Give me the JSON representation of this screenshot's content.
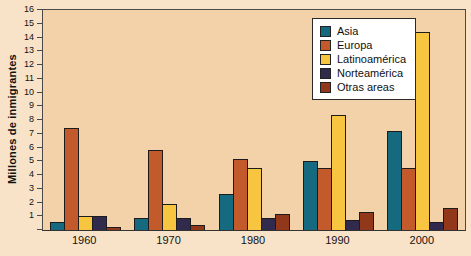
{
  "colors": {
    "page_bg": "#f8e3c9",
    "plot_bg": "#f3d2a9",
    "axis": "#4a4a4a",
    "bar_border": "#1c1c1c",
    "legend_bg": "#ffffff",
    "legend_border": "#2a2a2a",
    "text": "#111111"
  },
  "chart_data": {
    "type": "bar",
    "title": "",
    "xlabel": "",
    "ylabel": "Millones de inmigrantes",
    "ylim": [
      0,
      16
    ],
    "ytick_step": 1,
    "ytick_labels": [
      "1",
      "2",
      "3",
      "4",
      "5",
      "6",
      "7",
      "8",
      "9",
      "10",
      "11",
      "12",
      "13",
      "14",
      "15",
      "16"
    ],
    "grid": false,
    "legend_position": "top-right-inside",
    "categories": [
      "1960",
      "1970",
      "1980",
      "1990",
      "2000"
    ],
    "series": [
      {
        "name": "Asia",
        "color": "#156a7f",
        "values": [
          0.6,
          0.9,
          2.6,
          5.0,
          7.2
        ]
      },
      {
        "name": "Europa",
        "color": "#c35a2c",
        "values": [
          7.4,
          5.8,
          5.2,
          4.5,
          4.5
        ]
      },
      {
        "name": "Latinoamérica",
        "color": "#f7c53f",
        "values": [
          1.0,
          1.9,
          4.5,
          8.4,
          14.4
        ]
      },
      {
        "name": "Norteamérica",
        "color": "#322a4d",
        "values": [
          1.0,
          0.9,
          0.9,
          0.7,
          0.6
        ]
      },
      {
        "name": "Otras areas",
        "color": "#91381a",
        "values": [
          0.2,
          0.4,
          1.2,
          1.3,
          1.6
        ]
      }
    ]
  }
}
